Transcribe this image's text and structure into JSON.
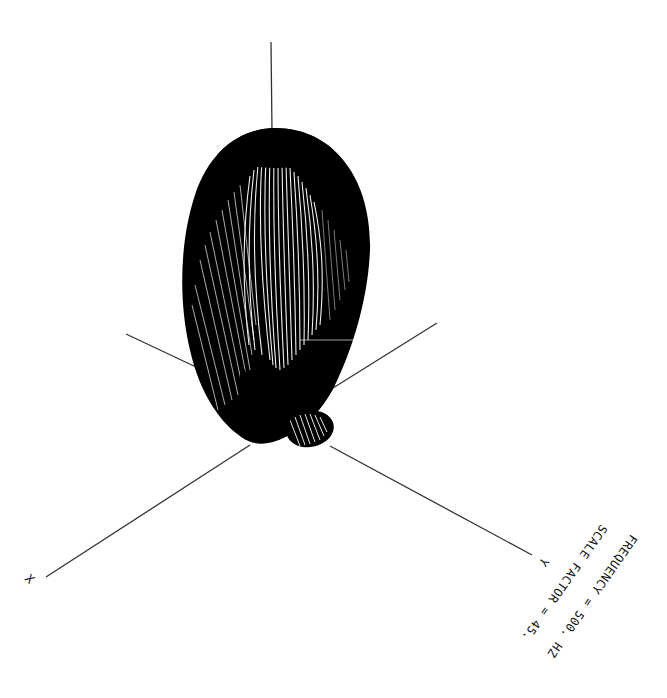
{
  "figure": {
    "type": "3d-radiation-pattern",
    "colors": {
      "background": "#ffffff",
      "surface": "#000000",
      "mesh_highlight": "#ffffff",
      "axis": "#333333",
      "text": "#111111"
    }
  },
  "axes": {
    "x": {
      "label": "X"
    },
    "y": {
      "label": "Y"
    },
    "z": {
      "label": ""
    }
  },
  "annotations": {
    "frequency_label": "FREQUENCY",
    "frequency_eq": "=",
    "frequency_value": "500.",
    "frequency_unit": "HZ",
    "frequency_text": "FREQUENCY = 500. HZ",
    "scale_label": "SCALE FACTOR",
    "scale_eq": "=",
    "scale_value": "45.",
    "scale_text": "SCALE FACTOR = 45."
  },
  "lobes": [
    {
      "name": "main-lobe",
      "orientation": "upward",
      "relative_size": "large"
    },
    {
      "name": "side-lobe",
      "orientation": "downward-right",
      "relative_size": "small"
    }
  ]
}
